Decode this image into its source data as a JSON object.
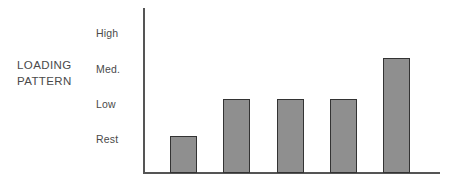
{
  "chart_data": {
    "type": "bar",
    "title": "",
    "subtitle": "",
    "xlabel": "",
    "ylabel": "LOADING PATTERN",
    "ylabel_lines": [
      "LOADING",
      "PATTERN"
    ],
    "categories": [
      "1",
      "2",
      "3",
      "4",
      "5"
    ],
    "y_tick_labels": [
      "High",
      "Med.",
      "Low",
      "Rest"
    ],
    "y_tick_values": [
      3,
      2,
      1,
      0
    ],
    "ylim": [
      0,
      3.6
    ],
    "values": [
      0.1,
      1.0,
      1.0,
      1.0,
      2.2
    ],
    "value_labels": [
      "Rest",
      "Low",
      "Low",
      "Low",
      "Med."
    ],
    "series": [
      {
        "name": "Loading pattern",
        "values": [
          0.1,
          1.0,
          1.0,
          1.0,
          2.2
        ]
      }
    ],
    "grid": false,
    "legend": false,
    "legend_position": "none",
    "x_tick_labels": [
      "",
      "",
      "",
      "",
      ""
    ],
    "bar_color": "#8f8f8f",
    "bar_border_color": "#333333",
    "axis_color": "#555555",
    "text_color": "#4a4a4a",
    "background_color": "#ffffff",
    "annotations": []
  },
  "labels": {
    "y_axis_block": {
      "line1": "LOADING",
      "line2": "PATTERN"
    },
    "ticks": {
      "high": "High",
      "med": "Med.",
      "low": "Low",
      "rest": "Rest"
    }
  },
  "geometry": {
    "baseline_y": 173,
    "axis_x": 143,
    "tick_y": [
      33,
      69,
      104,
      139
    ],
    "bar_width": 27,
    "bars": [
      {
        "x": 170,
        "top": 136
      },
      {
        "x": 223,
        "top": 99
      },
      {
        "x": 277,
        "top": 99
      },
      {
        "x": 330,
        "top": 99
      },
      {
        "x": 383,
        "top": 58
      }
    ]
  }
}
